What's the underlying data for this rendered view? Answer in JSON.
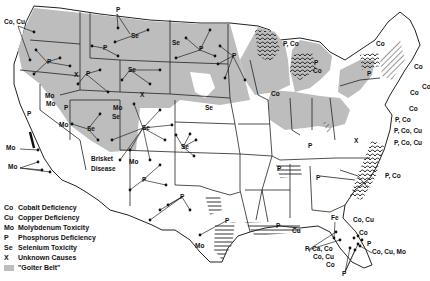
{
  "map": {
    "subject": "Mineral deficiencies and toxicities in livestock, United States",
    "colors": {
      "goiter_belt": "#bdbdbd",
      "land": "#ffffff",
      "border": "#222222",
      "hatch": "#333333"
    },
    "annotations": [
      {
        "text": "Co, Cu",
        "x": 4,
        "y": 24
      },
      {
        "text": "P",
        "x": 116,
        "y": 12
      },
      {
        "text": "Se",
        "x": 131,
        "y": 38
      },
      {
        "text": "P",
        "x": 103,
        "y": 50
      },
      {
        "text": "P",
        "x": 47,
        "y": 64
      },
      {
        "text": "X",
        "x": 74,
        "y": 77
      },
      {
        "text": "P",
        "x": 86,
        "y": 76
      },
      {
        "text": "Se",
        "x": 128,
        "y": 72
      },
      {
        "text": "Se",
        "x": 172,
        "y": 45
      },
      {
        "text": "P",
        "x": 199,
        "y": 51
      },
      {
        "text": "P",
        "x": 232,
        "y": 58
      },
      {
        "text": "Mo",
        "x": 45,
        "y": 98
      },
      {
        "text": "Mo",
        "x": 46,
        "y": 106
      },
      {
        "text": "P",
        "x": 64,
        "y": 110
      },
      {
        "text": "Mo",
        "x": 59,
        "y": 127
      },
      {
        "text": "Se",
        "x": 87,
        "y": 131
      },
      {
        "text": "Se",
        "x": 112,
        "y": 119
      },
      {
        "text": "Mo",
        "x": 113,
        "y": 110
      },
      {
        "text": "X",
        "x": 140,
        "y": 97
      },
      {
        "text": "Se",
        "x": 142,
        "y": 130
      },
      {
        "text": "Se",
        "x": 205,
        "y": 110
      },
      {
        "text": "Se",
        "x": 181,
        "y": 149
      },
      {
        "text": "Mo",
        "x": 6,
        "y": 150
      },
      {
        "text": "Mo",
        "x": 8,
        "y": 169
      },
      {
        "text": "P",
        "x": 27,
        "y": 116
      },
      {
        "text": "Mo",
        "x": 129,
        "y": 164
      },
      {
        "text": "P",
        "x": 142,
        "y": 182
      },
      {
        "text": "P",
        "x": 180,
        "y": 199
      },
      {
        "text": "P",
        "x": 225,
        "y": 223
      },
      {
        "text": "Mo",
        "x": 195,
        "y": 248
      },
      {
        "text": "P",
        "x": 276,
        "y": 228
      },
      {
        "text": "Cu",
        "x": 292,
        "y": 233
      },
      {
        "text": "P, Co",
        "x": 283,
        "y": 46
      },
      {
        "text": "P",
        "x": 314,
        "y": 65
      },
      {
        "text": "Co",
        "x": 313,
        "y": 73
      },
      {
        "text": "Co",
        "x": 271,
        "y": 96
      },
      {
        "text": "Co",
        "x": 376,
        "y": 46
      },
      {
        "text": "P",
        "x": 367,
        "y": 76
      },
      {
        "text": "Co",
        "x": 414,
        "y": 69
      },
      {
        "text": "Co",
        "x": 422,
        "y": 89
      },
      {
        "text": "Co",
        "x": 410,
        "y": 95
      },
      {
        "text": "Co",
        "x": 409,
        "y": 111
      },
      {
        "text": "P, Co",
        "x": 395,
        "y": 122
      },
      {
        "text": "P, Co, Cu",
        "x": 394,
        "y": 133
      },
      {
        "text": "P, Co, Cu",
        "x": 394,
        "y": 145
      },
      {
        "text": "X",
        "x": 354,
        "y": 143
      },
      {
        "text": "P, Co",
        "x": 385,
        "y": 178
      },
      {
        "text": "P",
        "x": 308,
        "y": 148
      },
      {
        "text": "P",
        "x": 277,
        "y": 171
      },
      {
        "text": "P",
        "x": 316,
        "y": 180
      },
      {
        "text": "Fe",
        "x": 331,
        "y": 220
      },
      {
        "text": "Co, Cu",
        "x": 353,
        "y": 222
      },
      {
        "text": "Co",
        "x": 359,
        "y": 235
      },
      {
        "text": "P",
        "x": 367,
        "y": 246
      },
      {
        "text": "P, Ca, Co",
        "x": 305,
        "y": 251
      },
      {
        "text": "Co, Cu",
        "x": 313,
        "y": 259
      },
      {
        "text": "Co, Cu, Mo",
        "x": 372,
        "y": 254
      },
      {
        "text": "Co",
        "x": 326,
        "y": 267
      },
      {
        "text": "P",
        "x": 342,
        "y": 276
      },
      {
        "text": "Brisket",
        "x": 91,
        "y": 161
      },
      {
        "text": "Disease",
        "x": 91,
        "y": 171
      }
    ]
  },
  "legend": {
    "items": [
      {
        "code": "Co",
        "label": "Cobalt Deficiency"
      },
      {
        "code": "Cu",
        "label": "Copper Deficiency"
      },
      {
        "code": "Mo",
        "label": "Molybdenum Toxicity"
      },
      {
        "code": "P",
        "label": "Phosphorus Deficiency"
      },
      {
        "code": "Se",
        "label": "Selenium Toxicity"
      },
      {
        "code": "X",
        "label": "Unknown Causes"
      },
      {
        "code": "",
        "label": "\"Goiter Belt\""
      }
    ]
  }
}
